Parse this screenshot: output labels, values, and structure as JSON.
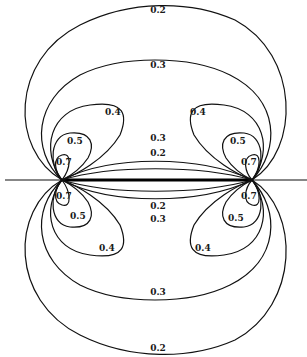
{
  "diagram": {
    "type": "contour plot (equipotential lines of two line charges / slot)",
    "poles": [
      {
        "x": 62,
        "y": 180
      },
      {
        "x": 252,
        "y": 180
      }
    ],
    "contour_labels": {
      "outer_top": "0.2",
      "second_top": "0.3",
      "lobe_top_left": "0.4",
      "lobe_top_right": "0.4",
      "inner_top_left": "0.5",
      "inner_top_right": "0.5",
      "pole_top_left": "0.7",
      "pole_top_right": "0.7",
      "pole_bottom_left": "0.7",
      "pole_bottom_right": "0.7",
      "inner_bottom_left": "0.5",
      "inner_bottom_right": "0.5",
      "lobe_bottom_left": "0.4",
      "lobe_bottom_right": "0.4",
      "mid_upper_03": "0.3",
      "mid_upper_02": "0.2",
      "mid_lower_02": "0.2",
      "mid_lower_03": "0.3",
      "second_bottom": "0.3",
      "outer_bottom": "0.2"
    },
    "levels": [
      "0.2",
      "0.3",
      "0.4",
      "0.5",
      "0.7"
    ]
  }
}
